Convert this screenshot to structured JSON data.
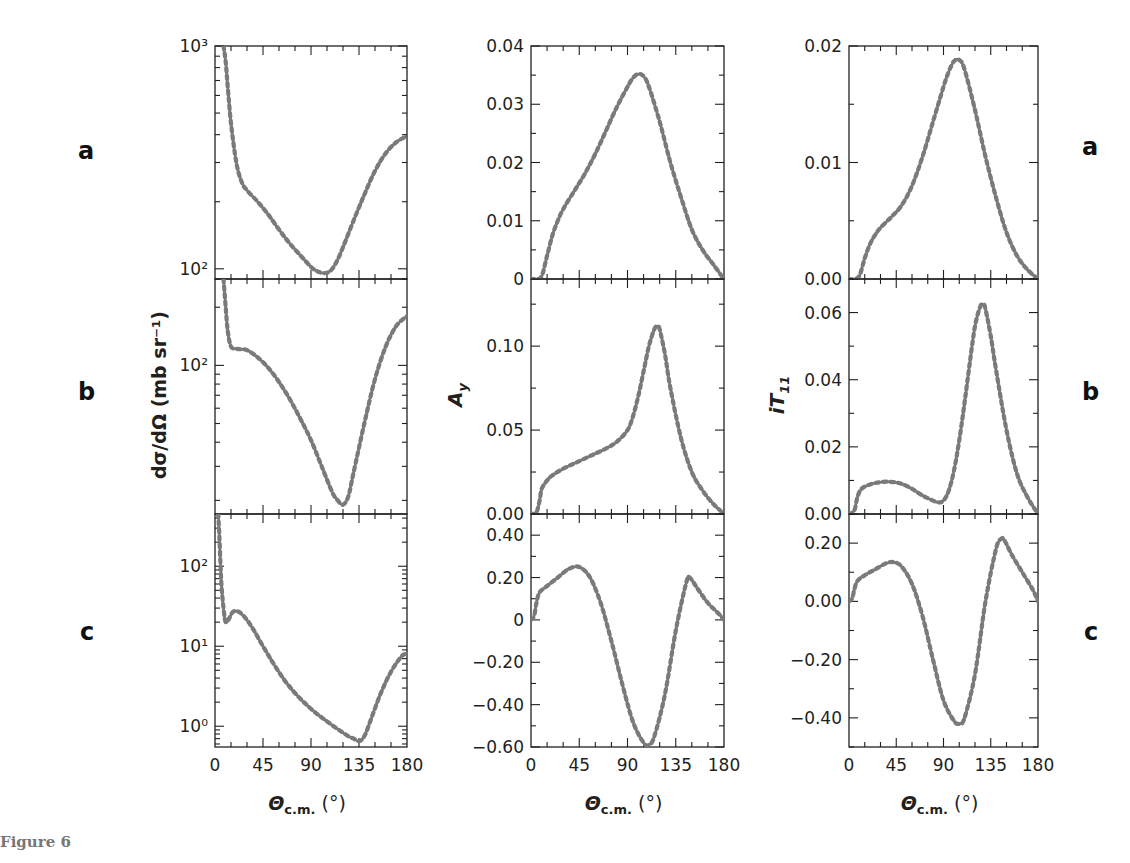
{
  "figure": {
    "caption": "Figure 6",
    "row_labels_left": [
      "a",
      "b",
      "c"
    ],
    "row_labels_right": [
      "a",
      "b",
      "c"
    ],
    "line_color": "#555555",
    "dot_color": "#7a7a7a",
    "axis_color": "#231f20"
  },
  "chart_data": [
    {
      "type": "line",
      "id": "dsigma-a",
      "column": 0,
      "row": 0,
      "ylabel": "dσ/dΩ (mb sr⁻¹)",
      "xlabel": "",
      "yscale": "log",
      "ylim": [
        90,
        1000
      ],
      "xlim": [
        0,
        180
      ],
      "yticks": [
        {
          "v": 100,
          "label": "10²"
        },
        {
          "v": 1000,
          "label": "10³"
        }
      ],
      "x": [
        8,
        10,
        12,
        15,
        20,
        25,
        30,
        40,
        50,
        60,
        70,
        80,
        90,
        95,
        100,
        105,
        110,
        115,
        120,
        130,
        140,
        150,
        160,
        170,
        180
      ],
      "values": [
        1000,
        850,
        650,
        450,
        300,
        245,
        225,
        200,
        175,
        150,
        130,
        115,
        102,
        98,
        96,
        96,
        100,
        110,
        125,
        165,
        215,
        275,
        330,
        370,
        395
      ]
    },
    {
      "type": "line",
      "id": "dsigma-b",
      "column": 0,
      "row": 1,
      "ylabel": "dσ/dΩ (mb sr⁻¹)",
      "xlabel": "",
      "yscale": "log",
      "ylim": [
        17,
        280
      ],
      "xlim": [
        0,
        180
      ],
      "yticks": [
        {
          "v": 100,
          "label": "10²"
        }
      ],
      "x": [
        8,
        10,
        12,
        15,
        20,
        25,
        30,
        40,
        50,
        60,
        70,
        80,
        90,
        100,
        110,
        115,
        120,
        125,
        130,
        140,
        150,
        160,
        170,
        180
      ],
      "values": [
        280,
        200,
        150,
        125,
        122,
        121,
        120,
        110,
        97,
        82,
        67,
        53,
        41,
        30,
        22,
        20,
        19,
        21,
        28,
        50,
        85,
        125,
        160,
        180
      ]
    },
    {
      "type": "line",
      "id": "dsigma-c",
      "column": 0,
      "row": 2,
      "ylabel": "dσ/dΩ (mb sr⁻¹)",
      "xlabel": "Θc.m. (°)",
      "yscale": "log",
      "ylim": [
        0.55,
        450
      ],
      "xlim": [
        0,
        180
      ],
      "xticks": [
        0,
        45,
        90,
        135,
        180
      ],
      "yticks": [
        {
          "v": 1,
          "label": "10⁰"
        },
        {
          "v": 10,
          "label": "10¹"
        },
        {
          "v": 100,
          "label": "10²"
        }
      ],
      "x": [
        3,
        4,
        5,
        6,
        8,
        10,
        13,
        17,
        22,
        28,
        35,
        45,
        55,
        65,
        75,
        85,
        95,
        105,
        115,
        125,
        130,
        135,
        140,
        145,
        155,
        165,
        175,
        180
      ],
      "values": [
        450,
        250,
        120,
        60,
        30,
        20,
        22,
        27,
        27,
        23,
        17,
        10,
        6,
        3.8,
        2.6,
        1.9,
        1.45,
        1.15,
        0.92,
        0.75,
        0.7,
        0.65,
        0.75,
        1.1,
        2.5,
        4.8,
        7.5,
        8
      ]
    },
    {
      "type": "line",
      "id": "ay-a",
      "column": 1,
      "row": 0,
      "ylabel": "A_y",
      "xlabel": "",
      "yscale": "linear",
      "ylim": [
        0,
        0.04
      ],
      "xlim": [
        0,
        180
      ],
      "yticks": [
        {
          "v": 0,
          "label": "0"
        },
        {
          "v": 0.01,
          "label": "0.01"
        },
        {
          "v": 0.02,
          "label": "0.02"
        },
        {
          "v": 0.03,
          "label": "0.03"
        },
        {
          "v": 0.04,
          "label": "0.04"
        }
      ],
      "x": [
        0,
        5,
        10,
        15,
        20,
        25,
        30,
        40,
        50,
        60,
        70,
        80,
        90,
        95,
        100,
        105,
        110,
        120,
        130,
        140,
        150,
        160,
        170,
        180
      ],
      "values": [
        0,
        0,
        0.0005,
        0.004,
        0.0075,
        0.01,
        0.012,
        0.015,
        0.018,
        0.0215,
        0.0255,
        0.0295,
        0.033,
        0.0345,
        0.0352,
        0.0348,
        0.033,
        0.027,
        0.02,
        0.014,
        0.0085,
        0.005,
        0.0025,
        0
      ]
    },
    {
      "type": "line",
      "id": "ay-b",
      "column": 1,
      "row": 1,
      "ylabel": "A_y",
      "xlabel": "",
      "yscale": "linear",
      "ylim": [
        0,
        0.14
      ],
      "xlim": [
        0,
        180
      ],
      "yticks": [
        {
          "v": 0,
          "label": "0.00"
        },
        {
          "v": 0.05,
          "label": "0.05"
        },
        {
          "v": 0.1,
          "label": "0.10"
        }
      ],
      "x": [
        0,
        5,
        8,
        10,
        15,
        20,
        30,
        40,
        50,
        60,
        70,
        80,
        90,
        95,
        100,
        105,
        110,
        115,
        118,
        120,
        125,
        130,
        140,
        150,
        160,
        170,
        180
      ],
      "values": [
        0,
        0.001,
        0.008,
        0.015,
        0.02,
        0.023,
        0.027,
        0.03,
        0.033,
        0.036,
        0.039,
        0.043,
        0.05,
        0.058,
        0.07,
        0.085,
        0.1,
        0.11,
        0.112,
        0.11,
        0.095,
        0.075,
        0.045,
        0.025,
        0.014,
        0.006,
        0
      ]
    },
    {
      "type": "line",
      "id": "ay-c",
      "column": 1,
      "row": 2,
      "ylabel": "A_y",
      "xlabel": "Θc.m. (°)",
      "yscale": "linear",
      "ylim": [
        -0.6,
        0.5
      ],
      "xlim": [
        0,
        180
      ],
      "xticks": [
        0,
        45,
        90,
        135,
        180
      ],
      "yticks": [
        {
          "v": -0.6,
          "label": "−0.60"
        },
        {
          "v": -0.4,
          "label": "−0.40"
        },
        {
          "v": -0.2,
          "label": "−0.20"
        },
        {
          "v": 0,
          "label": "0"
        },
        {
          "v": 0.2,
          "label": "0.20"
        },
        {
          "v": 0.4,
          "label": "0.40"
        }
      ],
      "x": [
        0,
        3,
        5,
        8,
        15,
        25,
        35,
        45,
        55,
        65,
        75,
        85,
        95,
        105,
        110,
        115,
        125,
        135,
        145,
        148,
        155,
        165,
        175,
        180
      ],
      "values": [
        0,
        0.02,
        0.08,
        0.13,
        0.16,
        0.2,
        0.24,
        0.25,
        0.2,
        0.08,
        -0.1,
        -0.3,
        -0.48,
        -0.58,
        -0.59,
        -0.55,
        -0.35,
        -0.05,
        0.18,
        0.2,
        0.15,
        0.08,
        0.03,
        0
      ]
    },
    {
      "type": "line",
      "id": "it11-a",
      "column": 2,
      "row": 0,
      "ylabel": "iT_11",
      "xlabel": "",
      "yscale": "linear",
      "ylim": [
        0,
        0.02
      ],
      "xlim": [
        0,
        180
      ],
      "yticks": [
        {
          "v": 0,
          "label": "0.00"
        },
        {
          "v": 0.01,
          "label": "0.01"
        },
        {
          "v": 0.02,
          "label": "0.02"
        }
      ],
      "x": [
        0,
        5,
        10,
        15,
        20,
        25,
        30,
        40,
        50,
        60,
        70,
        80,
        90,
        95,
        100,
        105,
        110,
        120,
        130,
        140,
        150,
        160,
        170,
        180
      ],
      "values": [
        0,
        0,
        0.0003,
        0.0018,
        0.003,
        0.0038,
        0.0044,
        0.0053,
        0.0063,
        0.008,
        0.0105,
        0.0135,
        0.0165,
        0.0178,
        0.0187,
        0.0188,
        0.018,
        0.0145,
        0.0105,
        0.007,
        0.004,
        0.002,
        0.0008,
        0
      ]
    },
    {
      "type": "line",
      "id": "it11-b",
      "column": 2,
      "row": 1,
      "ylabel": "iT_11",
      "xlabel": "",
      "yscale": "linear",
      "ylim": [
        0,
        0.07
      ],
      "xlim": [
        0,
        180
      ],
      "yticks": [
        {
          "v": 0,
          "label": "0.00"
        },
        {
          "v": 0.02,
          "label": "0.02"
        },
        {
          "v": 0.04,
          "label": "0.04"
        },
        {
          "v": 0.06,
          "label": "0.06"
        }
      ],
      "x": [
        0,
        5,
        8,
        12,
        20,
        30,
        40,
        50,
        60,
        70,
        80,
        85,
        90,
        95,
        100,
        105,
        110,
        115,
        120,
        125,
        128,
        130,
        135,
        140,
        150,
        160,
        170,
        180
      ],
      "values": [
        0,
        0.001,
        0.005,
        0.0075,
        0.0088,
        0.0095,
        0.0096,
        0.009,
        0.0075,
        0.0055,
        0.004,
        0.0035,
        0.004,
        0.007,
        0.013,
        0.022,
        0.033,
        0.045,
        0.056,
        0.0618,
        0.0625,
        0.061,
        0.053,
        0.043,
        0.025,
        0.012,
        0.005,
        0
      ]
    },
    {
      "type": "line",
      "id": "it11-c",
      "column": 2,
      "row": 2,
      "ylabel": "iT_11",
      "xlabel": "Θc.m. (°)",
      "yscale": "linear",
      "ylim": [
        -0.5,
        0.3
      ],
      "xlim": [
        0,
        180
      ],
      "xticks": [
        0,
        45,
        90,
        135,
        180
      ],
      "yticks": [
        {
          "v": -0.4,
          "label": "−0.40"
        },
        {
          "v": -0.2,
          "label": "−0.20"
        },
        {
          "v": 0,
          "label": "0.00"
        },
        {
          "v": 0.2,
          "label": "0.20"
        }
      ],
      "x": [
        0,
        3,
        5,
        8,
        15,
        25,
        35,
        42,
        50,
        60,
        70,
        80,
        90,
        100,
        105,
        110,
        120,
        130,
        140,
        145,
        148,
        155,
        165,
        175,
        180
      ],
      "values": [
        0,
        0.01,
        0.04,
        0.07,
        0.09,
        0.11,
        0.13,
        0.135,
        0.12,
        0.06,
        -0.05,
        -0.2,
        -0.34,
        -0.41,
        -0.42,
        -0.4,
        -0.25,
        0.0,
        0.18,
        0.215,
        0.21,
        0.16,
        0.1,
        0.04,
        0
      ]
    }
  ],
  "layout": {
    "columns": [
      {
        "left": 215,
        "right": 407,
        "ylabel": "dσ/dΩ (mb sr⁻¹)"
      },
      {
        "left": 531,
        "right": 724,
        "ylabel": "A",
        "ylabel_sub": "y"
      },
      {
        "left": 849,
        "right": 1038,
        "ylabel": "iT",
        "ylabel_sub": "11"
      }
    ],
    "rows": [
      46,
      279,
      514,
      747
    ],
    "xlabel_main": "Θ",
    "xlabel_sub": "c.m.",
    "xlabel_unit": " (°)"
  }
}
